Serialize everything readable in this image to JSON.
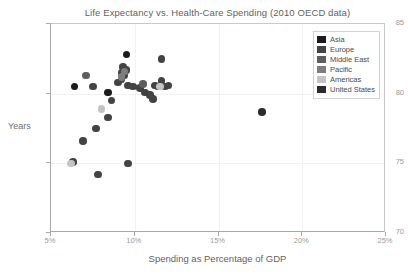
{
  "chart_data": {
    "type": "scatter",
    "title": "Life Expectancy vs. Health-Care Spending (2010 OECD data)",
    "xlabel": "Spending as Percentage of GDP",
    "ylabel": "Years",
    "xlim": [
      5,
      25
    ],
    "ylim": [
      70,
      85
    ],
    "xticks": [
      5,
      10,
      15,
      20,
      25
    ],
    "xtick_labels": [
      "5%",
      "10%",
      "15%",
      "20%",
      "25%"
    ],
    "yticks": [
      70,
      75,
      80,
      85
    ],
    "ytick_labels": [
      "70",
      "75",
      "80",
      "85"
    ],
    "grid": true,
    "legend_position": "top-right",
    "legend": [
      {
        "name": "Asia",
        "color": "#1a1a1a"
      },
      {
        "name": "Europe",
        "color": "#434343"
      },
      {
        "name": "Middle East",
        "color": "#5e5e5e"
      },
      {
        "name": "Pacific",
        "color": "#7d7d7d"
      },
      {
        "name": "Americas",
        "color": "#c4c4c4"
      },
      {
        "name": "United States",
        "color": "#2b2b2b"
      }
    ],
    "series": [
      {
        "name": "Asia",
        "color": "#1a1a1a",
        "points": [
          {
            "x": 6.4,
            "y": 80.5
          },
          {
            "x": 9.5,
            "y": 82.8
          },
          {
            "x": 8.4,
            "y": 80.1
          }
        ]
      },
      {
        "name": "Europe",
        "color": "#434343",
        "points": [
          {
            "x": 7.5,
            "y": 80.5
          },
          {
            "x": 9.3,
            "y": 81.9
          },
          {
            "x": 9.5,
            "y": 81.7
          },
          {
            "x": 9.2,
            "y": 81.5
          },
          {
            "x": 9.4,
            "y": 81.3
          },
          {
            "x": 9.2,
            "y": 81.0
          },
          {
            "x": 9.0,
            "y": 80.8
          },
          {
            "x": 9.6,
            "y": 80.6
          },
          {
            "x": 9.9,
            "y": 80.5
          },
          {
            "x": 10.3,
            "y": 80.4
          },
          {
            "x": 10.6,
            "y": 80.1
          },
          {
            "x": 10.9,
            "y": 79.9
          },
          {
            "x": 11.1,
            "y": 79.6
          },
          {
            "x": 11.6,
            "y": 82.5
          },
          {
            "x": 11.6,
            "y": 80.9
          },
          {
            "x": 11.4,
            "y": 80.5
          },
          {
            "x": 12.0,
            "y": 80.6
          },
          {
            "x": 11.8,
            "y": 80.5
          },
          {
            "x": 8.6,
            "y": 79.5
          },
          {
            "x": 8.4,
            "y": 78.3
          },
          {
            "x": 7.7,
            "y": 77.5
          },
          {
            "x": 6.9,
            "y": 76.6
          },
          {
            "x": 6.3,
            "y": 75.1
          },
          {
            "x": 7.8,
            "y": 74.2
          },
          {
            "x": 9.6,
            "y": 75.0
          },
          {
            "x": 11.2,
            "y": 80.6
          }
        ]
      },
      {
        "name": "Middle East",
        "color": "#5e5e5e",
        "points": [
          {
            "x": 10.5,
            "y": 80.7
          },
          {
            "x": 7.1,
            "y": 81.3
          }
        ]
      },
      {
        "name": "Pacific",
        "color": "#7d7d7d",
        "points": [
          {
            "x": 9.4,
            "y": 81.6
          },
          {
            "x": 9.2,
            "y": 81.2
          }
        ]
      },
      {
        "name": "Americas",
        "color": "#c4c4c4",
        "points": [
          {
            "x": 8.0,
            "y": 78.9
          },
          {
            "x": 6.2,
            "y": 75.0
          },
          {
            "x": 11.5,
            "y": 80.5
          }
        ]
      },
      {
        "name": "United States",
        "color": "#2b2b2b",
        "points": [
          {
            "x": 17.6,
            "y": 78.7
          }
        ]
      }
    ]
  }
}
